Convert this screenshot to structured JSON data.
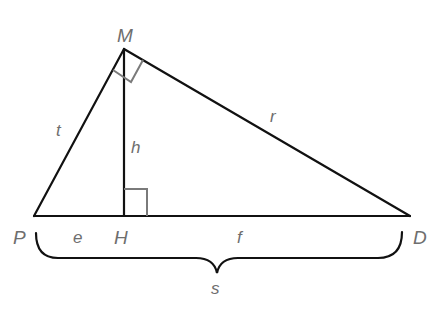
{
  "diagram": {
    "type": "right-triangle-with-altitude",
    "vertices": [
      {
        "id": "M",
        "label": "M",
        "x": 124,
        "y": 49
      },
      {
        "id": "P",
        "label": "P",
        "x": 34,
        "y": 216
      },
      {
        "id": "H",
        "label": "H",
        "x": 124,
        "y": 216
      },
      {
        "id": "D",
        "label": "D",
        "x": 410,
        "y": 216
      }
    ],
    "segments": [
      {
        "id": "PM",
        "label": "t"
      },
      {
        "id": "MD",
        "label": "r"
      },
      {
        "id": "MH",
        "label": "h"
      },
      {
        "id": "PH",
        "label": "e"
      },
      {
        "id": "HD",
        "label": "f"
      },
      {
        "id": "PD",
        "label": "s"
      }
    ],
    "right_angles": [
      "M",
      "H"
    ],
    "colors": {
      "lines": "#111111",
      "labels": "#6e6e6e",
      "markers": "#7a7a7a",
      "background": "#ffffff"
    }
  },
  "labels": {
    "M": "M",
    "P": "P",
    "H": "H",
    "D": "D",
    "t": "t",
    "r": "r",
    "h": "h",
    "e": "e",
    "f": "f",
    "s": "s"
  }
}
